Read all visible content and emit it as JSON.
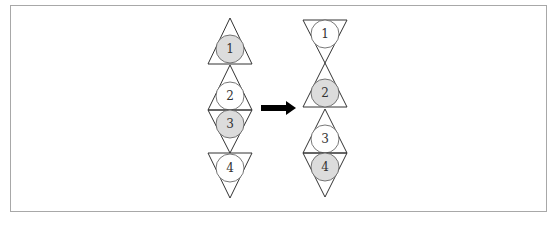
{
  "diagram": {
    "colors": {
      "shaded": "#dcdcdc",
      "unshaded": "#ffffff",
      "stroke": "#333333",
      "frame": "#a8a8a8",
      "arrow": "#000000"
    },
    "before": {
      "items": [
        {
          "label": "1",
          "orientation": "up",
          "shaded": true
        },
        {
          "label": "2",
          "orientation": "up",
          "shaded": false
        },
        {
          "label": "3",
          "orientation": "down",
          "shaded": true
        },
        {
          "label": "4",
          "orientation": "down",
          "shaded": false
        }
      ]
    },
    "after": {
      "items": [
        {
          "label": "1",
          "orientation": "down",
          "shaded": false
        },
        {
          "label": "2",
          "orientation": "up",
          "shaded": true
        },
        {
          "label": "3",
          "orientation": "up",
          "shaded": false
        },
        {
          "label": "4",
          "orientation": "down",
          "shaded": true
        }
      ]
    },
    "arrow": {
      "direction": "right"
    }
  }
}
